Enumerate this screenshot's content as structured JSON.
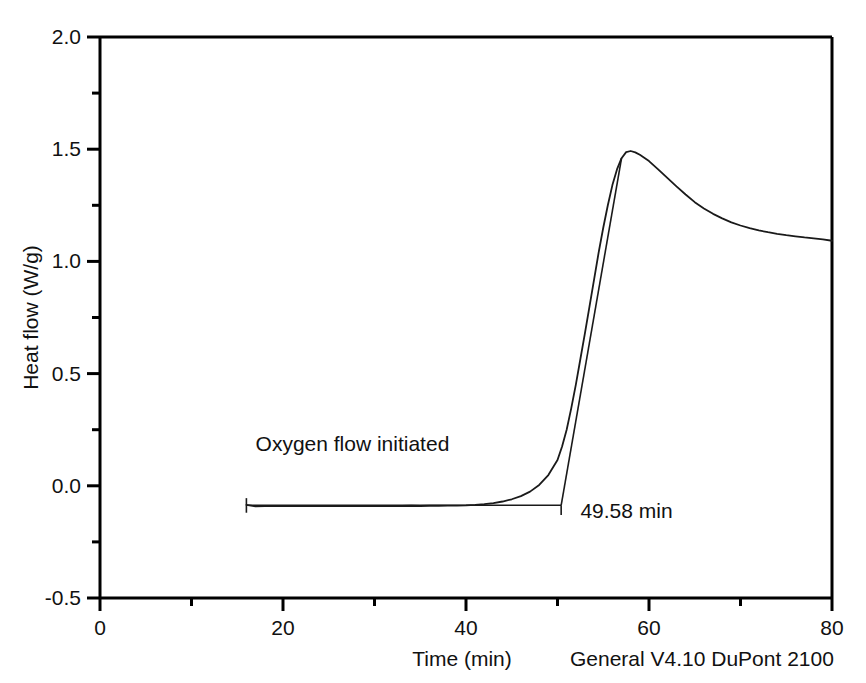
{
  "chart_data": {
    "type": "line",
    "title": "",
    "subtitle": "",
    "xlabel": "Time (min)",
    "ylabel": "Heat flow (W/g)",
    "xlim": [
      0,
      80
    ],
    "ylim": [
      -0.5,
      2.0
    ],
    "xticks": [
      0,
      20,
      40,
      60,
      80
    ],
    "xtick_labels": [
      "0",
      "20",
      "40",
      "60",
      "80"
    ],
    "xminor_ticks": [
      10,
      30,
      50,
      70
    ],
    "yticks": [
      -0.5,
      0.0,
      0.5,
      1.0,
      1.5,
      2.0
    ],
    "ytick_labels": [
      "-0.5",
      "0.0",
      "0.5",
      "1.0",
      "1.5",
      "2.0"
    ],
    "yminor_ticks": [
      -0.25,
      0.25,
      0.75,
      1.25,
      1.75
    ],
    "grid": false,
    "legend": "none",
    "line_color": "#1a1a1a",
    "axis_color": "#000000",
    "series": [
      {
        "name": "Heat flow",
        "x": [
          16.0,
          17.0,
          18.0,
          19.0,
          20.0,
          21.0,
          22.0,
          23.0,
          24.0,
          25.0,
          26.0,
          27.0,
          28.0,
          29.0,
          30.0,
          31.0,
          32.0,
          33.0,
          34.0,
          35.0,
          36.0,
          37.0,
          38.0,
          39.0,
          40.0,
          41.0,
          42.0,
          43.0,
          44.0,
          45.0,
          46.0,
          47.0,
          48.0,
          49.0,
          50.0,
          50.5,
          51.0,
          51.5,
          52.0,
          52.5,
          53.0,
          53.5,
          54.0,
          54.5,
          55.0,
          55.5,
          56.0,
          56.5,
          57.0,
          57.5,
          58.0,
          58.5,
          59.0,
          60.0,
          61.0,
          62.0,
          63.0,
          64.0,
          65.0,
          66.0,
          67.0,
          68.0,
          69.0,
          70.0,
          71.0,
          72.0,
          73.0,
          74.0,
          75.0,
          76.0,
          77.0,
          78.0,
          79.0,
          80.0
        ],
        "y": [
          -0.085,
          -0.092,
          -0.09,
          -0.091,
          -0.09,
          -0.091,
          -0.09,
          -0.091,
          -0.09,
          -0.091,
          -0.09,
          -0.091,
          -0.09,
          -0.091,
          -0.09,
          -0.091,
          -0.09,
          -0.09,
          -0.089,
          -0.09,
          -0.089,
          -0.089,
          -0.088,
          -0.088,
          -0.087,
          -0.085,
          -0.082,
          -0.077,
          -0.07,
          -0.06,
          -0.046,
          -0.026,
          0.004,
          0.048,
          0.115,
          0.175,
          0.25,
          0.345,
          0.45,
          0.565,
          0.68,
          0.8,
          0.92,
          1.04,
          1.15,
          1.25,
          1.34,
          1.41,
          1.46,
          1.487,
          1.492,
          1.486,
          1.475,
          1.447,
          1.41,
          1.372,
          1.334,
          1.298,
          1.264,
          1.236,
          1.212,
          1.192,
          1.174,
          1.16,
          1.148,
          1.138,
          1.13,
          1.123,
          1.117,
          1.112,
          1.107,
          1.103,
          1.098,
          1.092
        ]
      }
    ],
    "baseline": {
      "name": "baseline-extension",
      "y_value": -0.087,
      "x_start": 16.0,
      "x_end": 50.4
    },
    "tangent": {
      "name": "tangent-extrapolation",
      "x_start": 50.4,
      "y_start": -0.087,
      "x_end": 57.0,
      "y_end": 1.46
    },
    "onset_marker": {
      "label": "49.58 min",
      "x": 50.4,
      "tick_top": -0.087,
      "tick_bottom": -0.13
    },
    "start_marker": {
      "label": "Oxygen flow initiated",
      "x": 16.0,
      "tick_top": -0.055,
      "tick_bottom": -0.12
    },
    "annotations": [
      {
        "name": "oxygen-flow-annotation",
        "text": "Oxygen flow initiated",
        "x": 17.0,
        "y": 0.155
      },
      {
        "name": "onset-time-annotation",
        "text": "49.58 min",
        "x": 52.5,
        "y": -0.145
      }
    ]
  },
  "footer": {
    "instrument": "General V4.10 DuPont 2100"
  }
}
